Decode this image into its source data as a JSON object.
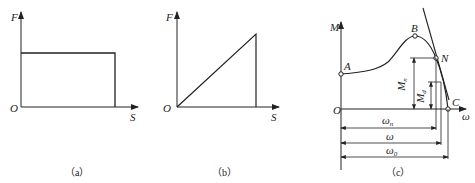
{
  "panels": [
    {
      "id": "a",
      "caption": "（a）",
      "axis_x": "S",
      "axis_y": "F",
      "origin": "O",
      "description": "Constant force over displacement (rectangle)"
    },
    {
      "id": "b",
      "caption": "（b）",
      "axis_x": "S",
      "axis_y": "F",
      "origin": "O",
      "description": "Linearly increasing force over displacement (triangle)"
    },
    {
      "id": "c",
      "caption": "（c）",
      "axis_x": "ω",
      "axis_y": "M",
      "origin": "O",
      "points": {
        "A": "A",
        "B": "B",
        "N": "N",
        "C": "C"
      },
      "torques": {
        "Mn": "M",
        "Mn_sub": "n",
        "Md": "M",
        "Md_sub": "d"
      },
      "speeds": {
        "wn": "ω",
        "wn_sub": "n",
        "w": "ω",
        "w0": "ω",
        "w0_sub": "0"
      },
      "description": "Motor mechanical characteristic: torque vs angular speed"
    }
  ]
}
